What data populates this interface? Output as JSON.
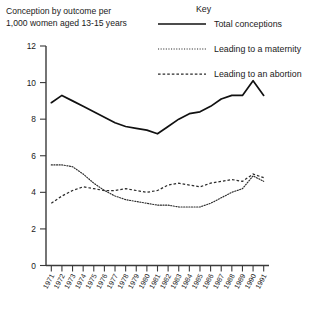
{
  "chart_data": {
    "type": "line",
    "title": "Conception by outcome per 1,000 women aged 13-15 years",
    "title_line1": "Conception by outcome per",
    "title_line2": "1,000 women aged 13-15 years",
    "xlabel": "",
    "ylabel": "",
    "ylim": [
      0,
      12
    ],
    "yticks": [
      0,
      2,
      4,
      6,
      8,
      10,
      12
    ],
    "grid": false,
    "legend_title": "Key",
    "legend_position": "top-right",
    "categories": [
      "1971",
      "1972",
      "1973",
      "1974",
      "1975",
      "1976",
      "1977",
      "1978",
      "1979",
      "1980",
      "1981",
      "1982",
      "1983",
      "1984",
      "1985",
      "1986",
      "1987",
      "1988",
      "1989",
      "1990",
      "1991"
    ],
    "series": [
      {
        "name": "Total  conceptions",
        "style": "solid",
        "values": [
          8.9,
          9.3,
          9.0,
          8.7,
          8.4,
          8.1,
          7.8,
          7.6,
          7.5,
          7.4,
          7.2,
          7.6,
          8.0,
          8.3,
          8.4,
          8.7,
          9.1,
          9.3,
          9.3,
          10.1,
          9.3
        ]
      },
      {
        "name": "Leading to a maternity",
        "style": "dotted",
        "values": [
          5.5,
          5.5,
          5.4,
          5.0,
          4.5,
          4.1,
          3.8,
          3.6,
          3.5,
          3.4,
          3.3,
          3.3,
          3.2,
          3.2,
          3.2,
          3.4,
          3.7,
          4.0,
          4.2,
          4.9,
          4.6
        ]
      },
      {
        "name": "Leading to an abortion",
        "style": "dashed",
        "values": [
          3.4,
          3.8,
          4.1,
          4.3,
          4.2,
          4.1,
          4.1,
          4.2,
          4.1,
          4.0,
          4.1,
          4.4,
          4.5,
          4.4,
          4.3,
          4.5,
          4.6,
          4.7,
          4.6,
          5.0,
          4.8
        ]
      }
    ]
  },
  "legend": {
    "title": "Key",
    "items": [
      {
        "label": "Total  conceptions",
        "style": "solid"
      },
      {
        "label": "Leading to a maternity",
        "style": "dotted"
      },
      {
        "label": "Leading to an abortion",
        "style": "dashed"
      }
    ]
  },
  "colors": {
    "line": "#111111",
    "axis": "#3a3a3a",
    "background": "#ffffff",
    "text": "#1a1a1a"
  }
}
